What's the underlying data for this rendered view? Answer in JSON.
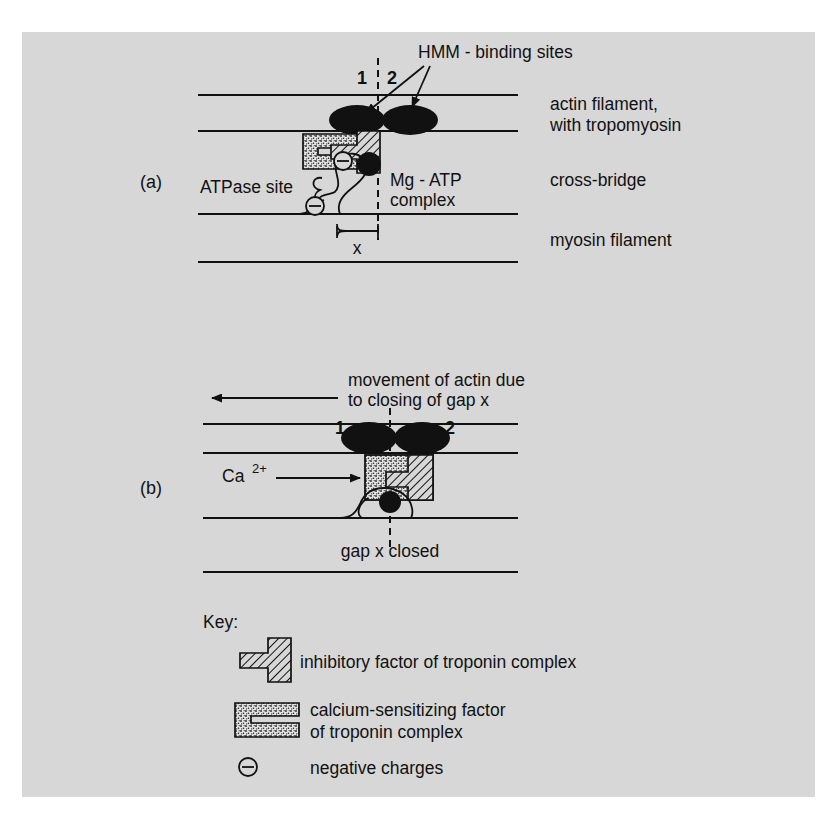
{
  "figure": {
    "background_color": "#d7d7d7",
    "ink_color": "#111111",
    "panels": [
      {
        "id": "a",
        "label": "(a)"
      },
      {
        "id": "b",
        "label": "(b)"
      }
    ]
  },
  "panel_a": {
    "label": "(a)",
    "annotations": {
      "hmm_binding_sites": "HMM - binding sites",
      "site_1": "1",
      "site_2": "2",
      "atpase_site": "ATPase site",
      "mg_atp_line1": "Mg - ATP",
      "mg_atp_line2": "complex",
      "gap_x": "x"
    },
    "right_labels": [
      {
        "line1": "actin filament,",
        "line2": "with tropomyosin"
      },
      {
        "line1": "cross-bridge",
        "line2": ""
      },
      {
        "line1": "myosin filament",
        "line2": ""
      }
    ]
  },
  "panel_b": {
    "label": "(b)",
    "annotations": {
      "movement_line1": "movement of actin due",
      "movement_line2": "to closing of gap x",
      "site_1": "1",
      "site_2": "2",
      "calcium_ion": "Ca",
      "calcium_ion_charge": "2+",
      "gap_closed": "gap x closed"
    }
  },
  "key": {
    "title": "Key:",
    "items": [
      {
        "symbol": "inhibitory-factor-symbol",
        "label_line1": "inhibitory factor of troponin complex",
        "label_line2": ""
      },
      {
        "symbol": "calcium-sensitizing-factor-symbol",
        "label_line1": "calcium-sensitizing factor",
        "label_line2": "of troponin complex"
      },
      {
        "symbol": "negative-charge-symbol",
        "glyph": "⊖",
        "label_line1": "negative charges",
        "label_line2": ""
      }
    ]
  }
}
